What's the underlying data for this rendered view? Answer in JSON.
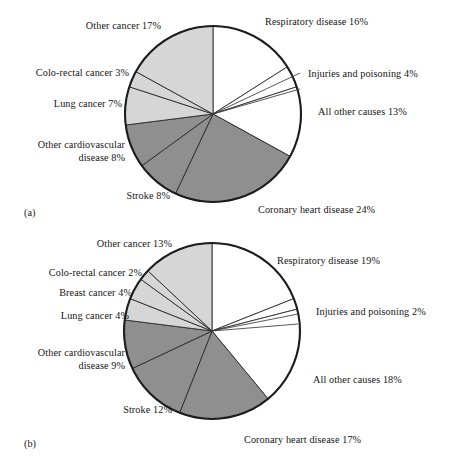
{
  "figure": {
    "panels": [
      {
        "tag": "(a)",
        "labels_right": [
          "Respiratory disease 16%",
          "Injuries and poisoning 4%",
          "All other causes 13%",
          "Coronary heart disease 24%"
        ],
        "labels_left": [
          "Other cancer 17%",
          "Colo-rectal cancer 3%",
          "Lung cancer 7%",
          "Other cardiovascular\ndisease 8%",
          "Stroke 8%"
        ]
      },
      {
        "tag": "(b)",
        "labels_right": [
          "Respiratory disease 19%",
          "Injuries and poisoning 2%",
          "All other causes 18%",
          "Coronary heart disease 17%"
        ],
        "labels_left": [
          "Other cancer 13%",
          "Colo-rectal cancer 2%",
          "Breast cancer 4%",
          "Lung cancer 4%",
          "Other cardiovascular\ndisease 9%",
          "Stroke 12%"
        ]
      }
    ]
  },
  "chart_data": [
    {
      "type": "pie",
      "title": "(a)",
      "start_angle_deg": 0,
      "direction": "clockwise",
      "legend_position": "outside-labels",
      "labels": [
        "Respiratory disease",
        "Injuries and poisoning",
        "All other causes",
        "Coronary heart disease",
        "Stroke",
        "Other cardiovascular disease",
        "Lung cancer",
        "Colo-rectal cancer",
        "Other cancer"
      ],
      "values": [
        16,
        4,
        13,
        24,
        8,
        8,
        7,
        3,
        17
      ],
      "value_labels": [
        "16%",
        "4%",
        "13%",
        "24%",
        "8%",
        "8%",
        "7%",
        "3%",
        "17%"
      ],
      "colors": [
        "#ffffff",
        "#ffffff",
        "#ffffff",
        "#8f8f8f",
        "#8f8f8f",
        "#8f8f8f",
        "#d6d6d6",
        "#d6d6d6",
        "#d6d6d6"
      ],
      "units": "percent"
    },
    {
      "type": "pie",
      "title": "(b)",
      "start_angle_deg": 0,
      "direction": "clockwise",
      "legend_position": "outside-labels",
      "labels": [
        "Respiratory disease",
        "Injuries and poisoning",
        "All other causes",
        "Coronary heart disease",
        "Stroke",
        "Other cardiovascular disease",
        "Lung cancer",
        "Breast cancer",
        "Colo-rectal cancer",
        "Other cancer"
      ],
      "values": [
        19,
        2,
        18,
        17,
        12,
        9,
        4,
        4,
        2,
        13
      ],
      "value_labels": [
        "19%",
        "2%",
        "18%",
        "17%",
        "12%",
        "9%",
        "4%",
        "4%",
        "2%",
        "13%"
      ],
      "colors": [
        "#ffffff",
        "#ffffff",
        "#ffffff",
        "#8f8f8f",
        "#8f8f8f",
        "#8f8f8f",
        "#d6d6d6",
        "#d6d6d6",
        "#d6d6d6",
        "#d6d6d6"
      ],
      "units": "percent"
    }
  ]
}
